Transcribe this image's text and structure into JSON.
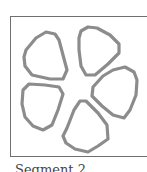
{
  "figure": {
    "caption": "Segment 2",
    "frame_color": "#6f6f6f",
    "outline_color": "#8c8c8c",
    "background": "#ffffff",
    "petals": [
      {
        "name": "upper-left-petal",
        "points": "26,50 36,38 46,32 55,34 59,40 63,55 67,70 63,79 50,79 32,75 25,66 24,57"
      },
      {
        "name": "upper-right-petal",
        "points": "81,31 88,27 97,28 110,35 119,44 119,53 108,64 95,75 86,75 81,66 79,50 79,38"
      },
      {
        "name": "right-petal",
        "points": "93,87 103,76 113,70 125,67 134,72 137,80 136,95 130,110 124,118 113,115 102,106 92,96"
      },
      {
        "name": "lower-left-petal",
        "points": "23,90 29,84 45,85 59,87 63,94 58,110 52,125 43,130 33,126 25,117 22,104"
      },
      {
        "name": "bottom-petal",
        "points": "67,128 74,110 80,101 86,101 98,113 107,125 108,139 98,146 88,152 75,149 66,143 63,136"
      }
    ]
  }
}
